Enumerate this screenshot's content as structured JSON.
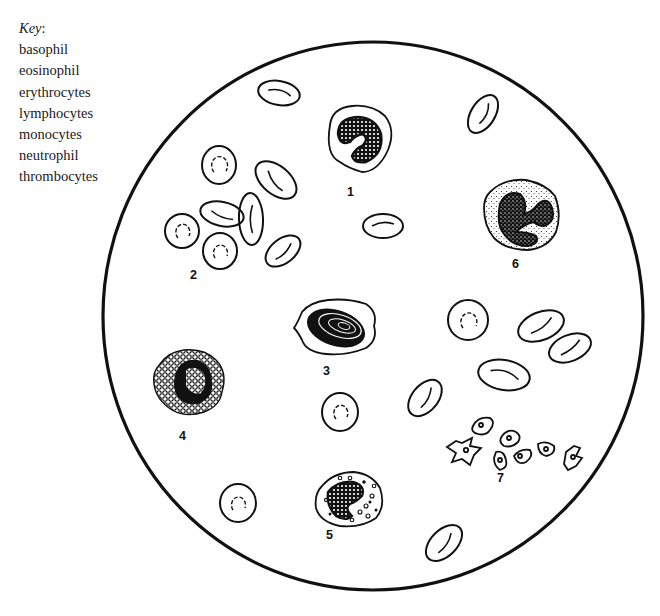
{
  "key": {
    "title": "Key",
    "title_suffix": ":",
    "items": [
      "basophil",
      "eosinophil",
      "erythrocytes",
      "lymphocytes",
      "monocytes",
      "neutrophil",
      "thrombocytes"
    ]
  },
  "diagram": {
    "field_circle": {
      "cx": 373,
      "cy": 316,
      "rx": 270,
      "ry": 274,
      "stroke": "#111111"
    },
    "labels": [
      {
        "id": "1",
        "text": "1",
        "x": 351,
        "y": 192
      },
      {
        "id": "2",
        "text": "2",
        "x": 193,
        "y": 275
      },
      {
        "id": "3",
        "text": "3",
        "x": 326,
        "y": 371
      },
      {
        "id": "4",
        "text": "4",
        "x": 182,
        "y": 436
      },
      {
        "id": "5",
        "text": "5",
        "x": 330,
        "y": 535
      },
      {
        "id": "6",
        "text": "6",
        "x": 515,
        "y": 264
      },
      {
        "id": "7",
        "text": "7",
        "x": 501,
        "y": 478
      }
    ]
  }
}
